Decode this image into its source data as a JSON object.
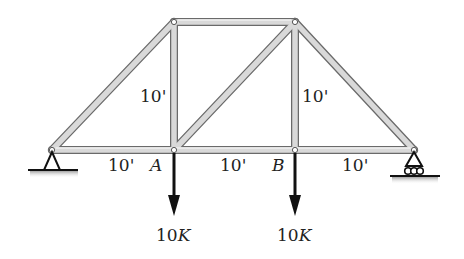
{
  "diagram": {
    "type": "truss",
    "colors": {
      "member_fill": "#d9d9d9",
      "member_stroke": "#6a6a6a",
      "load": "#111111",
      "ground": "#222222",
      "text": "#222222"
    },
    "joints": {
      "left_support": {
        "x": 52,
        "y": 150
      },
      "A": {
        "x": 174,
        "y": 150
      },
      "B": {
        "x": 295,
        "y": 150
      },
      "right_support": {
        "x": 414,
        "y": 150
      },
      "top_left": {
        "x": 174,
        "y": 22
      },
      "top_right": {
        "x": 295,
        "y": 22
      }
    },
    "labels": {
      "joint_a": "A",
      "joint_b": "B",
      "span_1": "10'",
      "span_2": "10'",
      "span_3": "10'",
      "height_left": "10'",
      "height_right": "10'",
      "load_a": "10K",
      "load_b": "10K"
    },
    "supports": {
      "left": "pin",
      "right": "roller"
    },
    "loads": [
      {
        "joint": "A",
        "magnitude": "10K",
        "direction": "down"
      },
      {
        "joint": "B",
        "magnitude": "10K",
        "direction": "down"
      }
    ]
  }
}
